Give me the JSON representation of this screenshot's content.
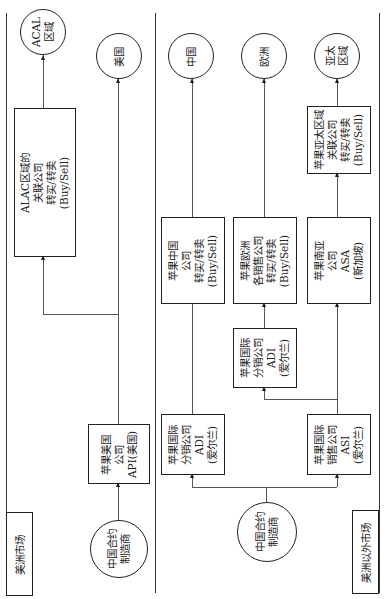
{
  "regions": {
    "americas": {
      "label": "美洲市场"
    },
    "non_americas": {
      "label": "美洲以外市场"
    }
  },
  "americas": {
    "manufacturer": {
      "lines": [
        "中国合约",
        "制造商"
      ]
    },
    "api": {
      "lines": [
        "苹果美国",
        "公司",
        "API(美国)"
      ]
    },
    "alac": {
      "lines": [
        "ALAC区域的",
        "关联公司",
        "转买/转卖",
        "(Buy/Sell)"
      ]
    },
    "acal": {
      "lines": [
        "ACAL",
        "区域"
      ]
    },
    "usa": {
      "lines": [
        "美国"
      ]
    }
  },
  "non_americas": {
    "manufacturer": {
      "lines": [
        "中国合约",
        "制造商"
      ]
    },
    "adi_1": {
      "lines": [
        "苹果国际",
        "分销公司",
        "ADI",
        "(爱尔兰)"
      ]
    },
    "asi": {
      "lines": [
        "苹果国际",
        "销售公司",
        "ASI",
        "(爱尔兰)"
      ]
    },
    "adi_2": {
      "lines": [
        "苹果国际",
        "分销公司",
        "ADI",
        "(爱尔兰)"
      ]
    },
    "china_co": {
      "lines": [
        "苹果中国",
        "公司",
        "转买/转卖",
        "(Buy/Sell)"
      ]
    },
    "europe_co": {
      "lines": [
        "苹果欧洲",
        "各销售公司",
        "转买/转卖",
        "(Buy/Sell)"
      ]
    },
    "asa": {
      "lines": [
        "苹果南亚",
        "公司",
        "ASA",
        "(新加坡)"
      ]
    },
    "apac_co": {
      "lines": [
        "苹果亚太区域",
        "关联公司",
        "转买/转卖",
        "(Buy/Sell)"
      ]
    },
    "china": {
      "lines": [
        "中国"
      ]
    },
    "europe": {
      "lines": [
        "欧洲"
      ]
    },
    "apac": {
      "lines": [
        "亚太",
        "区域"
      ]
    }
  }
}
